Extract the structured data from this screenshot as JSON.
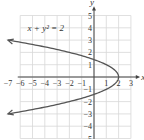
{
  "chart_data": {
    "type": "line",
    "title": "",
    "equation": "x + y² = 2",
    "xlabel": "x",
    "ylabel": "y",
    "xlim": [
      -7,
      3
    ],
    "ylim": [
      -5,
      5
    ],
    "x_ticks": [
      "−7",
      "−6",
      "−5",
      "−4",
      "−3",
      "−2",
      "−1",
      "1",
      "2",
      "3"
    ],
    "y_ticks": [
      "5",
      "4",
      "3",
      "2",
      "1",
      "−1",
      "−2",
      "−3",
      "−4",
      "−5"
    ],
    "grid": true,
    "series": [
      {
        "name": "x + y² = 2",
        "x": [
          -7,
          -4.25,
          -2,
          -0.25,
          1,
          1.75,
          2,
          1.75,
          1,
          -0.25,
          -2,
          -4.25,
          -7
        ],
        "y": [
          3,
          2.5,
          2,
          1.5,
          1,
          0.5,
          0,
          -0.5,
          -1,
          -1.5,
          -2,
          -2.5,
          -3
        ],
        "color": "#555555",
        "arrows_at_ends": true
      }
    ]
  }
}
